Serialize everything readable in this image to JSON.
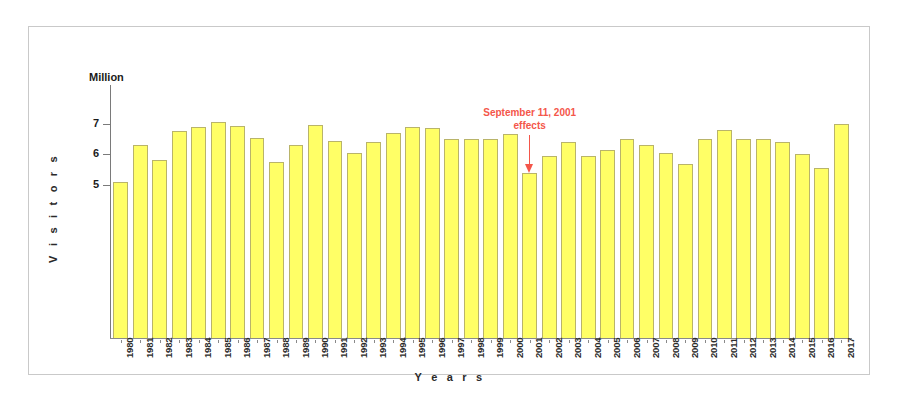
{
  "chart_data": {
    "type": "bar",
    "title": "",
    "unit_label": "Million",
    "xlabel": "Y e a r s",
    "ylabel": "V i s i t o r s",
    "grid": false,
    "legend": null,
    "ylim": [
      0,
      8.2
    ],
    "yticks": [
      5,
      6,
      7
    ],
    "ytick_labels": [
      "5",
      "6",
      "7"
    ],
    "categories": [
      "1980",
      "1981",
      "1982",
      "1983",
      "1984",
      "1985",
      "1986",
      "1987",
      "1988",
      "1989",
      "1990",
      "1991",
      "1992",
      "1993",
      "1994",
      "1995",
      "1996",
      "1997",
      "1998",
      "1999",
      "2000",
      "2001",
      "2002",
      "2003",
      "2004",
      "2005",
      "2006",
      "2007",
      "2008",
      "2009",
      "2010",
      "2011",
      "2012",
      "2013",
      "2014",
      "2015",
      "2016",
      "2017"
    ],
    "values": [
      5.1,
      6.3,
      5.8,
      6.75,
      6.9,
      7.05,
      6.93,
      6.55,
      5.75,
      6.3,
      6.95,
      6.45,
      6.05,
      6.4,
      6.7,
      6.9,
      6.85,
      6.5,
      6.5,
      6.5,
      6.65,
      5.4,
      5.95,
      6.4,
      5.95,
      6.15,
      6.5,
      6.3,
      6.05,
      5.7,
      6.5,
      6.8,
      6.5,
      6.5,
      6.4,
      6.0,
      5.55,
      7.0
    ],
    "annotations": [
      {
        "text_line1": "September 11, 2001",
        "text_line2": "effects",
        "color": "#f4564a",
        "points_to_category": "2001",
        "arrow": "down"
      }
    ],
    "bar_color": "#ffff66",
    "bar_border_color": "#b9b46a"
  }
}
